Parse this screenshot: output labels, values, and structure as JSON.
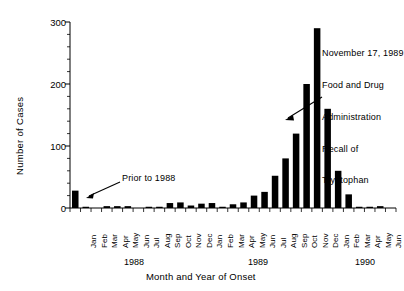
{
  "axes": {
    "ylabel": "Number of Cases",
    "xlabel": "Month and Year of Onset",
    "yticks": [
      "0",
      "100",
      "200",
      "300"
    ],
    "ylim": [
      0,
      300
    ],
    "yminor_step": 20,
    "grid": false
  },
  "annotations": {
    "prior": {
      "text": "Prior to 1988"
    },
    "recall": {
      "line1": "November 17, 1989",
      "line2": "Food and Drug",
      "line3": "Administration",
      "line4": "Recall of",
      "line5": "Tryptophan"
    }
  },
  "year_labels": [
    "1988",
    "1989",
    "1990"
  ],
  "chart_data": {
    "type": "bar",
    "title": "",
    "xlabel": "Month and Year of Onset",
    "ylabel": "Number of Cases",
    "ylim": [
      0,
      300
    ],
    "yticks": [
      0,
      100,
      200,
      300
    ],
    "grid": false,
    "legend": "none",
    "categories": [
      "Prior to 1988",
      "Jan 1988",
      "Feb 1988",
      "Mar 1988",
      "Apr 1988",
      "May 1988",
      "Jun 1988",
      "Jul 1988",
      "Aug 1988",
      "Sep 1988",
      "Oct 1988",
      "Nov 1988",
      "Dec 1988",
      "Jan 1989",
      "Feb 1989",
      "Mar 1989",
      "Apr 1989",
      "May 1989",
      "Jun 1989",
      "Jul 1989",
      "Aug 1989",
      "Sep 1989",
      "Oct 1989",
      "Nov 1989",
      "Dec 1989",
      "Jan 1990",
      "Feb 1990",
      "Mar 1990",
      "Apr 1990",
      "May 1990",
      "Jun 1990"
    ],
    "tick_labels": [
      "",
      "Jan",
      "Feb",
      "Mar",
      "Apr",
      "May",
      "Jun",
      "Jul",
      "Aug",
      "Sep",
      "Oct",
      "Nov",
      "Dec",
      "Jan",
      "Feb",
      "Mar",
      "Apr",
      "May",
      "Jun",
      "Jul",
      "Aug",
      "Sep",
      "Oct",
      "Nov",
      "Dec",
      "Jan",
      "Feb",
      "Mar",
      "Apr",
      "May",
      "Jun"
    ],
    "values": [
      28,
      2,
      0,
      3,
      3,
      3,
      0,
      2,
      2,
      8,
      9,
      4,
      7,
      8,
      2,
      6,
      9,
      20,
      26,
      52,
      80,
      120,
      200,
      290,
      160,
      60,
      22,
      2,
      2,
      3,
      0
    ],
    "bar_color": "#000000"
  }
}
